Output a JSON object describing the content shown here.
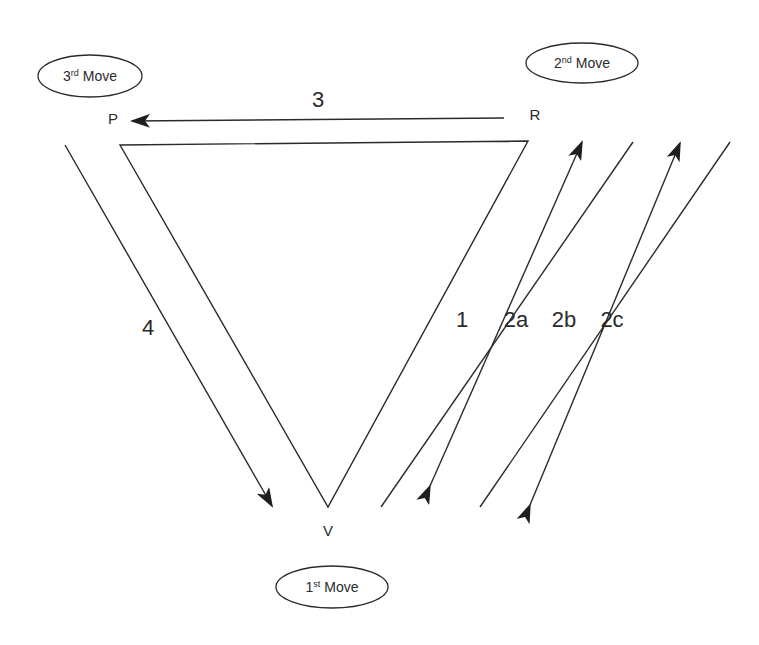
{
  "diagram": {
    "type": "triangle-cycle",
    "nodes": [
      {
        "id": "P",
        "label": "P"
      },
      {
        "id": "R",
        "label": "R"
      },
      {
        "id": "V",
        "label": "V"
      }
    ],
    "moves": [
      {
        "id": "move1",
        "num": "1",
        "sup": "st",
        "word": " Move",
        "attached_to": "V"
      },
      {
        "id": "move2",
        "num": "2",
        "sup": "nd",
        "word": " Move",
        "attached_to": "R"
      },
      {
        "id": "move3",
        "num": "3",
        "sup": "rd",
        "word": " Move",
        "attached_to": "P"
      }
    ],
    "arrows": [
      {
        "label": "1",
        "from": "V",
        "to": "R",
        "direction": "none"
      },
      {
        "label": "2a",
        "from": "V",
        "to": "R",
        "direction": "up"
      },
      {
        "label": "2b",
        "from": "R",
        "to": "V",
        "direction": "down"
      },
      {
        "label": "2c",
        "from": "V",
        "to": "R",
        "direction": "up-and-down"
      },
      {
        "label": "3",
        "from": "R",
        "to": "P",
        "direction": "left"
      },
      {
        "label": "4",
        "from": "P",
        "to": "V",
        "direction": "down"
      }
    ],
    "colors": {
      "stroke": "#2a2a2a",
      "background": "#ffffff"
    }
  }
}
